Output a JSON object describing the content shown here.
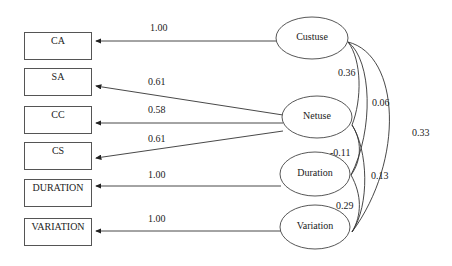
{
  "observed": [
    {
      "id": "CA",
      "label": "CA"
    },
    {
      "id": "SA",
      "label": "SA"
    },
    {
      "id": "CC",
      "label": "CC"
    },
    {
      "id": "CS",
      "label": "CS"
    },
    {
      "id": "DURATION",
      "label": "DURATION"
    },
    {
      "id": "VARIATION",
      "label": "VARIATION"
    }
  ],
  "latent": [
    {
      "id": "Custuse",
      "label": "Custuse"
    },
    {
      "id": "Netuse",
      "label": "Netuse"
    },
    {
      "id": "Duration",
      "label": "Duration"
    },
    {
      "id": "Variation",
      "label": "Variation"
    }
  ],
  "loadings": [
    {
      "from": "Custuse",
      "to": "CA",
      "value": "1.00"
    },
    {
      "from": "Netuse",
      "to": "SA",
      "value": "0.61"
    },
    {
      "from": "Netuse",
      "to": "CC",
      "value": "0.58"
    },
    {
      "from": "Netuse",
      "to": "CS",
      "value": "0.61"
    },
    {
      "from": "Duration",
      "to": "DURATION",
      "value": "1.00"
    },
    {
      "from": "Variation",
      "to": "VARIATION",
      "value": "1.00"
    }
  ],
  "covariances": [
    {
      "a": "Custuse",
      "b": "Netuse",
      "value": "0.36"
    },
    {
      "a": "Custuse",
      "b": "Duration",
      "value": "0.06"
    },
    {
      "a": "Custuse",
      "b": "Variation",
      "value": "0.33"
    },
    {
      "a": "Netuse",
      "b": "Duration",
      "value": "-0.11"
    },
    {
      "a": "Netuse",
      "b": "Variation",
      "value": "0.13"
    },
    {
      "a": "Duration",
      "b": "Variation",
      "value": "0.29"
    }
  ]
}
